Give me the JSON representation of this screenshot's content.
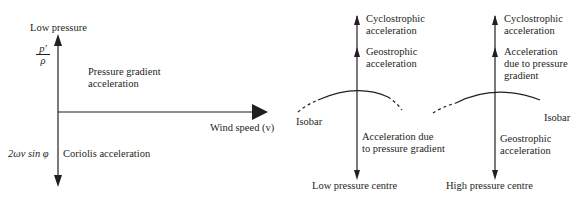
{
  "left_diagram": {
    "top_label": "Low pressure",
    "pressure_term": {
      "numerator": "p′",
      "denominator": "ρ"
    },
    "pressure_gradient_label": [
      "Pressure gradient",
      "acceleration"
    ],
    "x_axis_label": "Wind speed (v)",
    "coriolis_term": "2ωv sin φ",
    "coriolis_label": "Coriolis acceleration"
  },
  "low_pressure_diagram": {
    "up_label_1": [
      "Cyclostrophic",
      "acceleration"
    ],
    "up_label_2": [
      "Geostrophic",
      "acceleration"
    ],
    "isobar_label": "Isobar",
    "down_label": [
      "Acceleration due",
      "to pressure gradient"
    ],
    "caption": "Low pressure centre"
  },
  "high_pressure_diagram": {
    "up_label_1": [
      "Cyclostrophic",
      "acceleration"
    ],
    "up_label_2": [
      "Acceleration",
      "due to pressure",
      "gradient"
    ],
    "isobar_label": "Isobar",
    "down_label": [
      "Geostrophic",
      "acceleration"
    ],
    "caption": "High pressure centre"
  },
  "colors": {
    "ink": "#231f20",
    "background": "#ffffff"
  }
}
